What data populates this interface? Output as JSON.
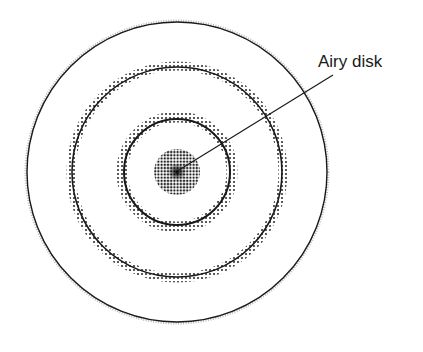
{
  "diagram": {
    "label": "Airy disk",
    "center": [
      177,
      172
    ],
    "outer_ring_radius": 150,
    "middle_ring_radius": 106,
    "inner_ring_radius": 55,
    "disk_radius": 23,
    "colors": {
      "ink": "#1a1a1a",
      "dot": "#333333",
      "background": "#ffffff"
    }
  }
}
